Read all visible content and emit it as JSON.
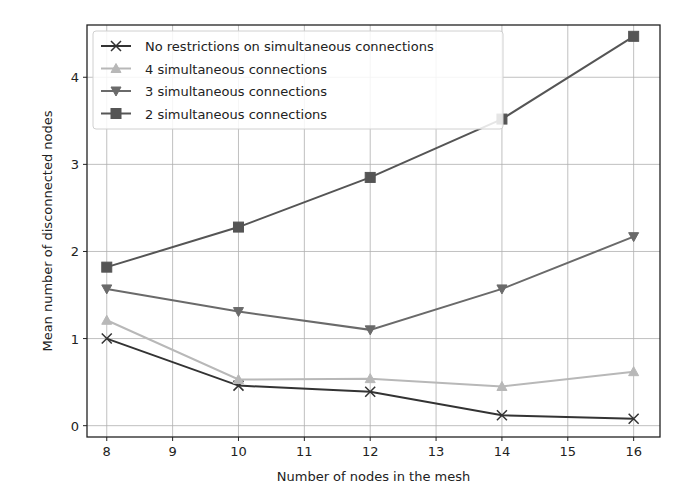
{
  "chart_data": {
    "type": "line",
    "title": "",
    "xlabel": "Number of nodes in the mesh",
    "ylabel": "Mean number of disconnected nodes",
    "x": [
      8,
      10,
      12,
      14,
      16
    ],
    "xlim": [
      7.7,
      16.4
    ],
    "ylim": [
      -0.13,
      4.6
    ],
    "xticks": [
      8,
      9,
      10,
      11,
      12,
      13,
      14,
      15,
      16
    ],
    "yticks": [
      0,
      1,
      2,
      3,
      4
    ],
    "grid": true,
    "legend_position": "top-left",
    "series": [
      {
        "name": "No restrictions on simultaneous connections",
        "marker": "x",
        "color": "#333333",
        "values": [
          1.0,
          0.46,
          0.39,
          0.12,
          0.08
        ]
      },
      {
        "name": "4 simultaneous connections",
        "marker": "triangle-up",
        "color": "#b8b8b8",
        "values": [
          1.21,
          0.53,
          0.54,
          0.45,
          0.62
        ]
      },
      {
        "name": "3 simultaneous connections",
        "marker": "triangle-down",
        "color": "#6a6a6a",
        "values": [
          1.57,
          1.31,
          1.1,
          1.57,
          2.17
        ]
      },
      {
        "name": "2 simultaneous connections",
        "marker": "square",
        "color": "#555555",
        "values": [
          1.82,
          2.28,
          2.85,
          3.52,
          4.47
        ]
      }
    ]
  }
}
